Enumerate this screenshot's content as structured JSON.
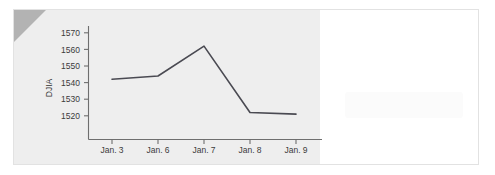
{
  "chart_data": {
    "type": "line",
    "title": "",
    "xlabel": "",
    "ylabel": "DJIA",
    "categories": [
      "Jan. 3",
      "Jan. 6",
      "Jan. 7",
      "Jan. 8",
      "Jan. 9"
    ],
    "values": [
      1542,
      1544,
      1562,
      1522,
      1521
    ],
    "series": [
      {
        "name": "DJIA",
        "values": [
          1542,
          1544,
          1562,
          1522,
          1521
        ]
      }
    ],
    "ylim": [
      1513,
      1574
    ],
    "yticks": [
      1520,
      1530,
      1540,
      1550,
      1560,
      1570
    ],
    "ytick_labels": [
      "1520",
      "1530",
      "1540",
      "1550",
      "1560",
      "1570"
    ],
    "grid": false,
    "legend": false,
    "line_color": "#4a4a52",
    "axis_color": "#6e6e6e"
  },
  "figure": {
    "panel_color": "#eeeeee",
    "page_color": "#ffffff",
    "border_color": "#e2e2e2",
    "corner_fold_color": "#b3b3b3"
  }
}
